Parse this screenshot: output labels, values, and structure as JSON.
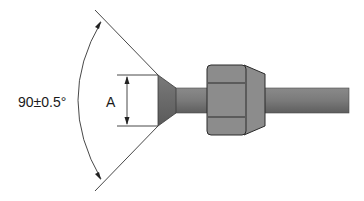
{
  "diagram": {
    "type": "technical-drawing",
    "labels": {
      "angle": "90±0.5°",
      "dimension": "A"
    },
    "colors": {
      "background": "#ffffff",
      "line": "#333333",
      "tube": "#7a7a7a",
      "tube_dark": "#5e5e5e",
      "flare": "#6a6a6a",
      "nut": "#8c8c8c",
      "nut_outline": "#2a2a2a"
    }
  }
}
